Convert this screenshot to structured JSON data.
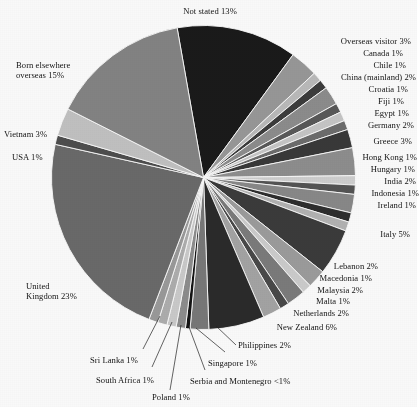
{
  "chart_data": {
    "type": "pie",
    "title": "",
    "subtitle": "",
    "xlabel": "",
    "ylabel": "",
    "legend_position": "none",
    "grid": false,
    "label_format": "{name} {value}%",
    "start_angle_deg": 350,
    "direction": "clockwise",
    "categories": [
      "Not stated",
      "Overseas visitor",
      "Canada",
      "Chile",
      "China (mainland)",
      "Croatia",
      "Fiji",
      "Egypt",
      "Germany",
      "Greece",
      "Hong Kong",
      "Hungary",
      "India",
      "Indonesia",
      "Ireland",
      "Italy",
      "Lebanon",
      "Macedonia",
      "Malaysia",
      "Malta",
      "Netherlands",
      "New Zealand",
      "Philippines",
      "Serbia and Montenegro",
      "Singapore",
      "Poland",
      "South Africa",
      "Sri Lanka",
      "United Kingdom",
      "USA",
      "Vietnam",
      "Born elsewhere overseas"
    ],
    "values": [
      13,
      3,
      1,
      1,
      2,
      1,
      1,
      1,
      2,
      3,
      1,
      1,
      2,
      1,
      1,
      5,
      2,
      1,
      2,
      1,
      2,
      6,
      2,
      0.5,
      1,
      1,
      1,
      1,
      23,
      1,
      3,
      15
    ],
    "value_labels": [
      "13%",
      "3%",
      "1%",
      "1%",
      "2%",
      "1%",
      "1%",
      "1%",
      "2%",
      "3%",
      "1%",
      "1%",
      "2%",
      "1%",
      "1%",
      "5%",
      "2%",
      "1%",
      "2%",
      "1%",
      "2%",
      "6%",
      "2%",
      "<1%",
      "1%",
      "1%",
      "1%",
      "1%",
      "23%",
      "1%",
      "3%",
      "15%"
    ],
    "colors": [
      "#1a1a1a",
      "#9a9a9a",
      "#bdbdbd",
      "#3d3d3d",
      "#8e8e8e",
      "#5a5a5a",
      "#c9c9c9",
      "#6e6e6e",
      "#3a3a3a",
      "#909090",
      "#d2d2d2",
      "#555555",
      "#8a8a8a",
      "#2e2e2e",
      "#b5b5b5",
      "#3c3c3c",
      "#9e9e9e",
      "#cfcfcf",
      "#7d7d7d",
      "#4a4a4a",
      "#a6a6a6",
      "#2b2b2b",
      "#7a7a7a",
      "#141414",
      "#8f8f8f",
      "#cdcdcd",
      "#b0b0b0",
      "#9c9c9c",
      "#6b6b6b",
      "#4f4f4f",
      "#c4c4c4",
      "#858585"
    ],
    "units": "percent",
    "total_label": "100%"
  },
  "labels": [
    {
      "id": "not-stated",
      "text": "Not stated 13%"
    },
    {
      "id": "overseas-visitor",
      "text": "Overseas visitor 3%"
    },
    {
      "id": "canada",
      "text": "Canada 1%"
    },
    {
      "id": "chile",
      "text": "Chile 1%"
    },
    {
      "id": "china-mainland",
      "text": "China (mainland) 2%"
    },
    {
      "id": "croatia",
      "text": "Croatia 1%"
    },
    {
      "id": "fiji",
      "text": "Fiji 1%"
    },
    {
      "id": "egypt",
      "text": "Egypt 1%"
    },
    {
      "id": "germany",
      "text": "Germany 2%"
    },
    {
      "id": "greece",
      "text": "Greece 3%"
    },
    {
      "id": "hong-kong",
      "text": "Hong Kong 1%"
    },
    {
      "id": "hungary",
      "text": "Hungary 1%"
    },
    {
      "id": "india",
      "text": "India 2%"
    },
    {
      "id": "indonesia",
      "text": "Indonesia 1%"
    },
    {
      "id": "ireland",
      "text": "Ireland 1%"
    },
    {
      "id": "italy",
      "text": "Italy 5%"
    },
    {
      "id": "lebanon",
      "text": "Lebanon 2%"
    },
    {
      "id": "macedonia",
      "text": "Macedonia 1%"
    },
    {
      "id": "malaysia",
      "text": "Malaysia 2%"
    },
    {
      "id": "malta",
      "text": "Malta 1%"
    },
    {
      "id": "netherlands",
      "text": "Netherlands 2%"
    },
    {
      "id": "new-zealand",
      "text": "New Zealand 6%"
    },
    {
      "id": "philippines",
      "text": "Philippines 2%"
    },
    {
      "id": "serbia-montenegro",
      "text": "Serbia and Montenegro <1%"
    },
    {
      "id": "singapore",
      "text": "Singapore 1%"
    },
    {
      "id": "poland",
      "text": "Poland 1%"
    },
    {
      "id": "south-africa",
      "text": "South Africa 1%"
    },
    {
      "id": "sri-lanka",
      "text": "Sri Lanka 1%"
    },
    {
      "id": "united-kingdom-line1",
      "text": "United"
    },
    {
      "id": "united-kingdom-line2",
      "text": "Kingdom 23%"
    },
    {
      "id": "usa",
      "text": "USA 1%"
    },
    {
      "id": "vietnam",
      "text": "Vietnam 3%"
    },
    {
      "id": "born-elsewhere-line1",
      "text": "Born elsewhere"
    },
    {
      "id": "born-elsewhere-line2",
      "text": "overseas 15%"
    }
  ]
}
